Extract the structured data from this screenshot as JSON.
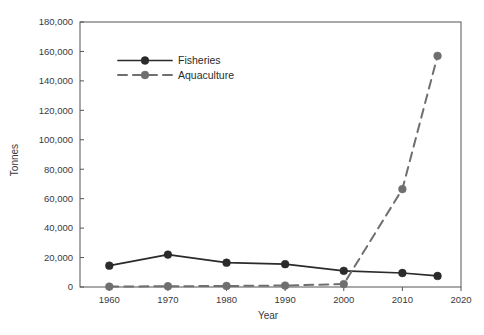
{
  "chart_data": {
    "type": "line",
    "title": "",
    "xlabel": "Year",
    "ylabel": "Tonnes",
    "x": [
      1960,
      1970,
      1980,
      1990,
      2000,
      2010,
      2016
    ],
    "xlim": [
      1955,
      2020
    ],
    "ylim": [
      0,
      180000
    ],
    "xticks": [
      1960,
      1970,
      1980,
      1990,
      2000,
      2010,
      2020
    ],
    "xtick_labels": [
      "1960",
      "1970",
      "1980",
      "1990",
      "2000",
      "2010",
      "2020"
    ],
    "yticks": [
      0,
      20000,
      40000,
      60000,
      80000,
      100000,
      120000,
      140000,
      160000,
      180000
    ],
    "ytick_labels": [
      "0",
      "20,000",
      "40,000",
      "60,000",
      "80,000",
      "100,000",
      "120,000",
      "140,000",
      "160,000",
      "180,000"
    ],
    "grid": false,
    "legend_position": "upper-left-inside",
    "series": [
      {
        "name": "Fisheries",
        "values": [
          14500,
          22000,
          16500,
          15500,
          11000,
          9500,
          7500
        ],
        "color": "#2b2b2b",
        "dash": "none",
        "marker": "circle"
      },
      {
        "name": "Aquaculture",
        "values": [
          300,
          500,
          700,
          1000,
          2000,
          66500,
          157000
        ],
        "color": "#6f6f6f",
        "dash": "dashed",
        "marker": "circle"
      }
    ]
  },
  "legend": {
    "entries": [
      {
        "label": "Fisheries"
      },
      {
        "label": "Aquaculture"
      }
    ]
  },
  "axes": {
    "x_title": "Year",
    "y_title": "Tonnes"
  }
}
